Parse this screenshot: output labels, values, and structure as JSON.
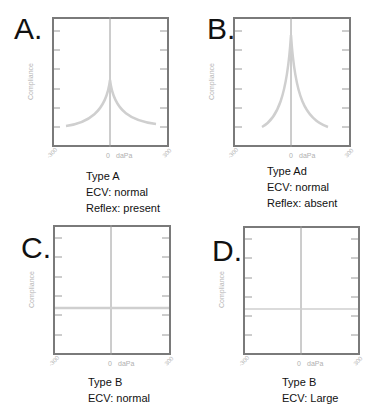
{
  "figure": {
    "panels": [
      {
        "letter": "A.",
        "type": "Type A",
        "ecv": "ECV: normal",
        "reflex": "Reflex: present",
        "ylabel": "Compliance",
        "xticks": [
          "-300",
          "0",
          "300"
        ],
        "xunit": "daPa",
        "curve": "peaked-moderate"
      },
      {
        "letter": "B.",
        "type": "Type Ad",
        "ecv": "ECV: normal",
        "reflex": "Reflex: absent",
        "ylabel": "Compliance",
        "xticks": [
          "-300",
          "0",
          "300"
        ],
        "xunit": "daPa",
        "curve": "peaked-tall"
      },
      {
        "letter": "C.",
        "type": "Type B",
        "ecv": "ECV: normal",
        "ylabel": "Compliance",
        "xticks": [
          "-300",
          "0",
          "300"
        ],
        "xunit": "daPa",
        "curve": "flat"
      },
      {
        "letter": "D.",
        "type": "Type B",
        "ecv": "ECV: Large",
        "ylabel": "Compliance",
        "xticks": [
          "-300",
          "0",
          "300"
        ],
        "xunit": "daPa",
        "curve": "flat"
      }
    ],
    "colors": {
      "frame": "#7a7a7a",
      "axis": "#9a9a9a",
      "curve": "#cfcfcf",
      "label": "#b5b5b5"
    }
  }
}
